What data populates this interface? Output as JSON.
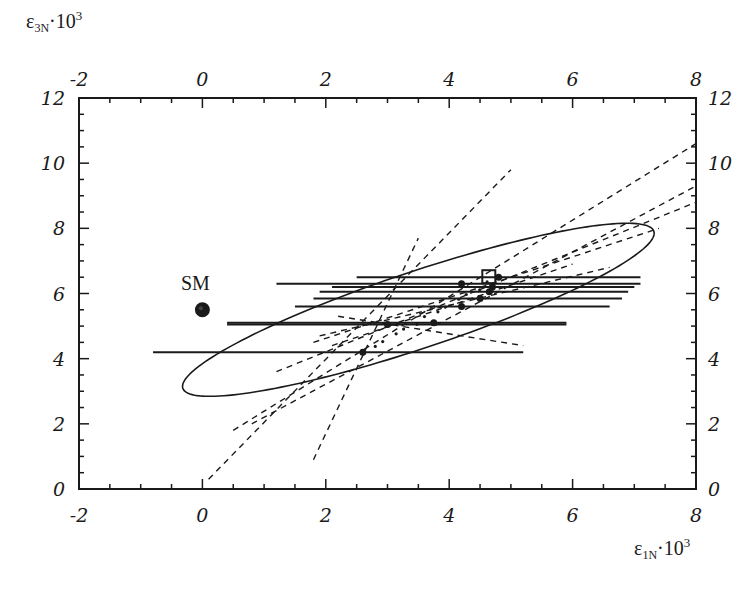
{
  "chart_data": {
    "type": "scatter",
    "title": "",
    "xlabel": "ε1N·10^3",
    "ylabel": "ε3N·10^3",
    "xlabel_parts": {
      "main": "ε",
      "sub": "1N",
      "tail": "·10",
      "sup": "3"
    },
    "ylabel_parts": {
      "main": "ε",
      "sub": "3N",
      "tail": "·10",
      "sup": "3"
    },
    "xlim": [
      -2,
      8
    ],
    "ylim": [
      0,
      12
    ],
    "x_ticks": [
      -2,
      0,
      2,
      4,
      6,
      8
    ],
    "y_ticks": [
      0,
      2,
      4,
      6,
      8,
      10,
      12
    ],
    "x_tick_labels": [
      "-2",
      "0",
      "2",
      "4",
      "6",
      "8"
    ],
    "y_tick_labels": [
      "0",
      "2",
      "4",
      "6",
      "8",
      "10",
      "12"
    ],
    "grid": false,
    "mirrored_axes": true,
    "annotations": [
      {
        "text": "SM",
        "x": 0,
        "y": 5.5
      }
    ],
    "sm_point": {
      "label": "SM",
      "x": 0.0,
      "y": 5.5
    },
    "best_fit_marker": {
      "shape": "open-square",
      "x": 4.65,
      "y": 6.5
    },
    "ellipse": {
      "cx": 3.5,
      "cy": 5.5,
      "semi_major": 4.6,
      "semi_minor": 1.05,
      "angle_deg": 33
    },
    "measurements": [
      {
        "x": 2.6,
        "y": 4.2,
        "x_err_low": -0.8,
        "x_err_high": 5.2
      },
      {
        "x": 3.0,
        "y": 5.05,
        "x_err_low": 0.4,
        "x_err_high": 5.9
      },
      {
        "x": 3.75,
        "y": 5.1,
        "x_err_low": 0.4,
        "x_err_high": 5.9
      },
      {
        "x": 4.2,
        "y": 5.6,
        "x_err_low": 1.5,
        "x_err_high": 6.6
      },
      {
        "x": 4.5,
        "y": 5.85,
        "x_err_low": 1.8,
        "x_err_high": 6.8
      },
      {
        "x": 4.65,
        "y": 6.05,
        "x_err_low": 1.9,
        "x_err_high": 6.9
      },
      {
        "x": 4.7,
        "y": 6.2,
        "x_err_low": 2.1,
        "x_err_high": 7.0
      },
      {
        "x": 4.2,
        "y": 6.3,
        "x_err_low": 1.2,
        "x_err_high": 7.1
      },
      {
        "x": 4.8,
        "y": 6.5,
        "x_err_low": 2.5,
        "x_err_high": 7.1
      }
    ],
    "dashed_lines": [
      {
        "x1": 0.1,
        "y1": 0.3,
        "x2": 5.0,
        "y2": 9.8
      },
      {
        "x1": 1.8,
        "y1": 0.9,
        "x2": 3.5,
        "y2": 7.7
      },
      {
        "x1": 0.5,
        "y1": 1.8,
        "x2": 8.0,
        "y2": 10.6
      },
      {
        "x1": 0.8,
        "y1": 2.0,
        "x2": 8.0,
        "y2": 9.3
      },
      {
        "x1": 1.2,
        "y1": 3.6,
        "x2": 8.0,
        "y2": 8.8
      },
      {
        "x1": 1.8,
        "y1": 4.5,
        "x2": 7.4,
        "y2": 8.0
      },
      {
        "x1": 1.9,
        "y1": 4.7,
        "x2": 6.6,
        "y2": 6.8
      },
      {
        "x1": 2.2,
        "y1": 5.3,
        "x2": 5.2,
        "y2": 4.4
      },
      {
        "x1": 2.1,
        "y1": 4.4,
        "x2": 6.0,
        "y2": 6.9
      }
    ]
  }
}
